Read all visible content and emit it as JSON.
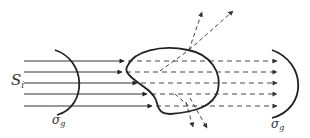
{
  "diagram": {
    "type": "scattering-schematic",
    "labels": {
      "incident_source": {
        "symbol": "S",
        "subscript": "i"
      },
      "left_surface": {
        "symbol": "σ",
        "subscript": "g"
      },
      "right_surface": {
        "symbol": "σ",
        "subscript": "g"
      }
    },
    "incident_rays": {
      "count": 5,
      "style": "solid",
      "y_positions": [
        61,
        72,
        83,
        94,
        106
      ]
    },
    "transmitted_rays": {
      "count": 5,
      "style": "dashed",
      "y_positions": [
        61,
        72,
        83,
        94,
        106
      ]
    },
    "scattered_rays_up": {
      "count": 2,
      "style": "dashed"
    },
    "scattered_rays_down": {
      "count": 2,
      "style": "dashed"
    },
    "colors": {
      "stroke": "#222222",
      "dashed": "#444444",
      "label": "#333333"
    }
  }
}
